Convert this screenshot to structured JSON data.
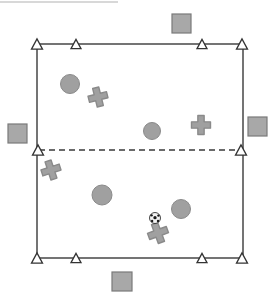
{
  "diagram": {
    "canvas": {
      "width": 273,
      "height": 294,
      "background": "#ffffff"
    },
    "colors": {
      "line": "#3a3a3a",
      "marker_fill": "#ffffff",
      "marker_stroke": "#333333",
      "player_fill": "#a0a0a0",
      "player_stroke": "#8a8a8a",
      "square_fill": "#a8a8a8",
      "square_stroke": "#7a7a7a",
      "ball_fill": "#f2f2f2",
      "ball_patch": "#1a1a1a",
      "artifact": "#d8d8d8"
    },
    "field": {
      "label": "playing-field-boundary",
      "x": 37,
      "y": 44,
      "width": 206,
      "height": 214,
      "stroke_width": 1.4
    },
    "midline": {
      "label": "dashed-midline",
      "x1": 39,
      "y1": 150,
      "x2": 241,
      "y2": 150,
      "dash": "6 4",
      "stroke_width": 1.4
    },
    "cones": [
      {
        "name": "cone-top-left-corner",
        "x": 37,
        "y": 44,
        "size": 11
      },
      {
        "name": "cone-top-inner-left",
        "x": 76,
        "y": 44,
        "size": 10
      },
      {
        "name": "cone-top-inner-right",
        "x": 202,
        "y": 44,
        "size": 10
      },
      {
        "name": "cone-top-right-corner",
        "x": 242,
        "y": 44,
        "size": 11
      },
      {
        "name": "cone-mid-left",
        "x": 38,
        "y": 150,
        "size": 11
      },
      {
        "name": "cone-mid-right",
        "x": 241,
        "y": 150,
        "size": 11
      },
      {
        "name": "cone-bottom-left-corner",
        "x": 37,
        "y": 258,
        "size": 11
      },
      {
        "name": "cone-bottom-inner-left",
        "x": 76,
        "y": 258,
        "size": 10
      },
      {
        "name": "cone-bottom-inner-right",
        "x": 202,
        "y": 258,
        "size": 10
      },
      {
        "name": "cone-bottom-right-corner",
        "x": 242,
        "y": 258,
        "size": 11
      }
    ],
    "squares": [
      {
        "name": "square-marker-top",
        "x": 172,
        "y": 14,
        "width": 19,
        "height": 19
      },
      {
        "name": "square-marker-left",
        "x": 8,
        "y": 124,
        "width": 19,
        "height": 19
      },
      {
        "name": "square-marker-right",
        "x": 248,
        "y": 117,
        "width": 19,
        "height": 19
      },
      {
        "name": "square-marker-bottom",
        "x": 112,
        "y": 272,
        "width": 20,
        "height": 19
      }
    ],
    "circle_players": [
      {
        "name": "circle-player-upper-left",
        "cx": 70,
        "cy": 84,
        "r": 9.5
      },
      {
        "name": "circle-player-center",
        "cx": 152,
        "cy": 131,
        "r": 8.5
      },
      {
        "name": "circle-player-lower-left",
        "cx": 102,
        "cy": 195,
        "r": 10
      },
      {
        "name": "circle-player-lower-right",
        "cx": 181,
        "cy": 209,
        "r": 9.5
      }
    ],
    "cross_players": [
      {
        "name": "cross-player-upper-left",
        "cx": 98,
        "cy": 97,
        "size": 19,
        "rotation": -14
      },
      {
        "name": "cross-player-upper-right",
        "cx": 201,
        "cy": 125,
        "size": 19,
        "rotation": 0
      },
      {
        "name": "cross-player-mid-left",
        "cx": 51,
        "cy": 170,
        "size": 19,
        "rotation": -18
      },
      {
        "name": "cross-player-bottom",
        "cx": 158,
        "cy": 233,
        "size": 20,
        "rotation": -20
      }
    ],
    "ball": {
      "name": "soccer-ball",
      "cx": 155,
      "cy": 218,
      "r": 5.5
    },
    "artifact_line": {
      "name": "scan-artifact-line",
      "x1": 0,
      "y1": 2,
      "x2": 118,
      "y2": 2
    }
  }
}
